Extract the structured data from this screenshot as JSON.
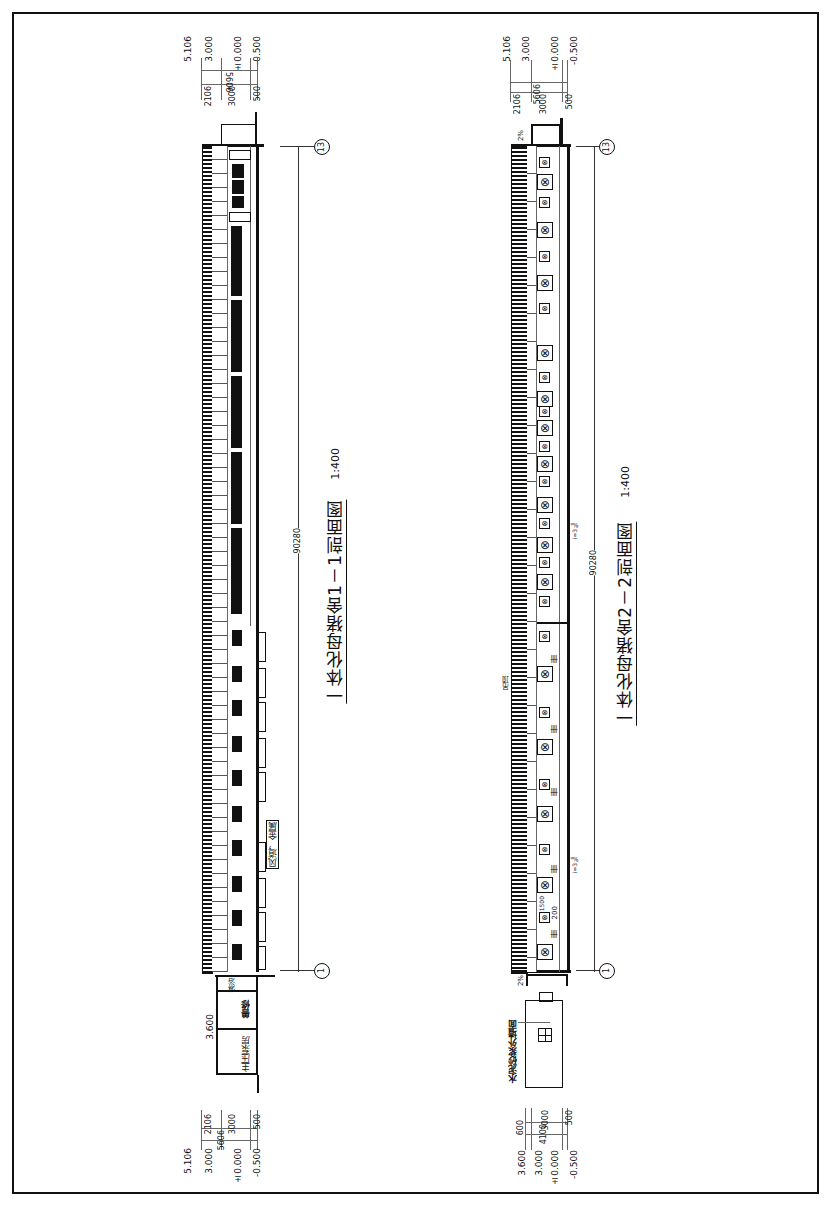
{
  "drawing": {
    "frame": "border",
    "section_1": {
      "title": "一体化母猪舍1－1剖面图",
      "scale": "1:400",
      "total_length": "90280",
      "axis_start": "1",
      "axis_end": "13",
      "top_levels": [
        "5.106",
        "3.000",
        "±0.000",
        "-0.500"
      ],
      "top_dims": {
        "total": "5606",
        "segments": [
          "2106",
          "3000",
          "500"
        ]
      },
      "bottom_levels": [
        "5.106",
        "3.000",
        "±0.000",
        "-0.500"
      ],
      "bottom_dims": {
        "total": "5606",
        "segments": [
          "2106",
          "3000",
          "500"
        ]
      },
      "rooms": [
        "主压泵房",
        "兽修",
        "淋浴"
      ],
      "annex_level": "3.600",
      "label_duct": "风道，金属"
    },
    "section_2": {
      "title": "一体化母猪舍2－2剖面图",
      "scale": "1:400",
      "total_length": "90280",
      "axis_start": "1",
      "axis_end": "13",
      "slope_top": "2%",
      "slope_bottom": "2%",
      "gutter_slope": "i=3‰",
      "gutter_slope_2": "i=3‰",
      "top_levels": [
        "5.106",
        "3.000",
        "±0.000",
        "-0.500"
      ],
      "top_dims": {
        "total": "5606",
        "segments": [
          "2106",
          "3000",
          "500"
        ]
      },
      "bottom_levels": [
        "3.600",
        "3.000",
        "±0.000",
        "-0.500"
      ],
      "bottom_dims": {
        "total": "4100",
        "segments": [
          "600",
          "3000",
          "500"
        ]
      },
      "wall_note": "水泥砂浆外墙面",
      "dim_200": "200",
      "dim_1500": "1500",
      "vent_label": "吊顶"
    }
  }
}
